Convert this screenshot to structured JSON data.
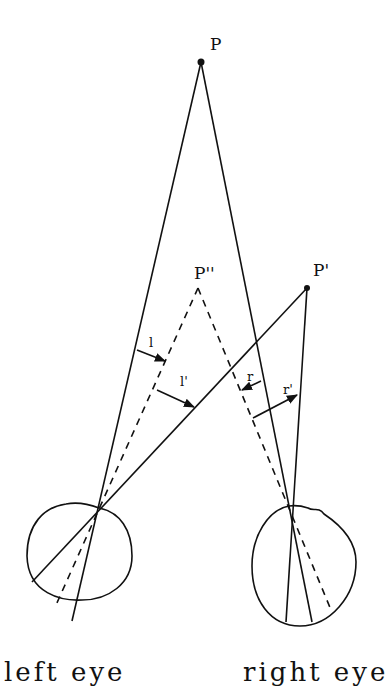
{
  "diagram": {
    "points": {
      "P": {
        "label": "P",
        "x": 201,
        "y": 62
      },
      "P_double_prime": {
        "label": "P''",
        "x": 198,
        "y": 288
      },
      "P_prime": {
        "label": "P'",
        "x": 307,
        "y": 288
      }
    },
    "angles": {
      "l": {
        "label": "l"
      },
      "l_prime": {
        "label": "l'"
      },
      "r": {
        "label": "r"
      },
      "r_prime": {
        "label": "r'"
      }
    },
    "eyes": {
      "left": {
        "label": "left eye"
      },
      "right": {
        "label": "right eye"
      }
    },
    "colors": {
      "stroke": "#111111",
      "background": "#ffffff"
    }
  }
}
